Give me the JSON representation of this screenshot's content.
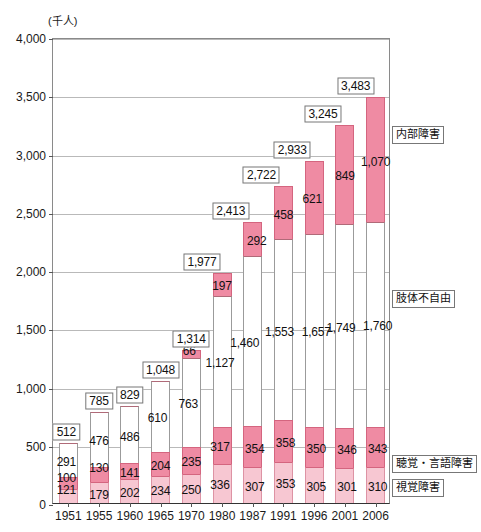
{
  "chart": {
    "unit_label": "(千人)",
    "y_ticks": [
      "0",
      "500",
      "1,000",
      "1,500",
      "2,000",
      "2,500",
      "3,000",
      "3,500",
      "4,000"
    ],
    "legend": [
      {
        "key": "naibu",
        "label": "内部障害"
      },
      {
        "key": "shitai",
        "label": "肢体不自由"
      },
      {
        "key": "choukaku",
        "label": "聴覚・言語障害"
      },
      {
        "key": "shikaku",
        "label": "視覚障害"
      }
    ],
    "colors": {
      "shikaku": "#f7c7d2",
      "choukaku": "#ef8ba3",
      "shitai": "#ffffff",
      "naibu": "#ef8ba3",
      "outline": "#d4657f",
      "grid": "#b9b9b9",
      "axis": "#555555"
    }
  },
  "chart_data": {
    "type": "bar",
    "title": "",
    "xlabel": "",
    "ylabel": "(千人)",
    "ylim": [
      0,
      4000
    ],
    "ytick_step": 500,
    "grid": true,
    "stacked": true,
    "legend_position": "right",
    "categories": [
      "1951",
      "1955",
      "1960",
      "1965",
      "1970",
      "1980",
      "1987",
      "1991",
      "1996",
      "2001",
      "2006"
    ],
    "series": [
      {
        "name": "視覚障害",
        "values": [
          121,
          179,
          202,
          234,
          250,
          336,
          307,
          353,
          305,
          301,
          310
        ]
      },
      {
        "name": "聴覚・言語障害",
        "values": [
          100,
          130,
          141,
          204,
          235,
          317,
          354,
          358,
          350,
          346,
          343
        ]
      },
      {
        "name": "肢体不自由",
        "values": [
          291,
          476,
          486,
          610,
          763,
          1127,
          1460,
          1553,
          1657,
          1749,
          1760
        ]
      },
      {
        "name": "内部障害",
        "values": [
          null,
          null,
          null,
          null,
          66,
          197,
          292,
          458,
          621,
          849,
          1070
        ]
      }
    ],
    "series_labels": [
      [
        "121",
        "179",
        "202",
        "234",
        "250",
        "336",
        "307",
        "353",
        "305",
        "301",
        "310"
      ],
      [
        "100",
        "130",
        "141",
        "204",
        "235",
        "317",
        "354",
        "358",
        "350",
        "346",
        "343"
      ],
      [
        "291",
        "476",
        "486",
        "610",
        "763",
        "1,127",
        "1,460",
        "1,553",
        "1,657",
        "1,749",
        "1,760"
      ],
      [
        "",
        "",
        "",
        "",
        "66",
        "197",
        "292",
        "458",
        "621",
        "849",
        "1,070"
      ]
    ],
    "totals": [
      512,
      785,
      829,
      1048,
      1314,
      1977,
      2413,
      2722,
      2933,
      3245,
      3483
    ],
    "total_labels": [
      "512",
      "785",
      "829",
      "1,048",
      "1,314",
      "1,977",
      "2,413",
      "2,722",
      "2,933",
      "3,245",
      "3,483"
    ]
  }
}
